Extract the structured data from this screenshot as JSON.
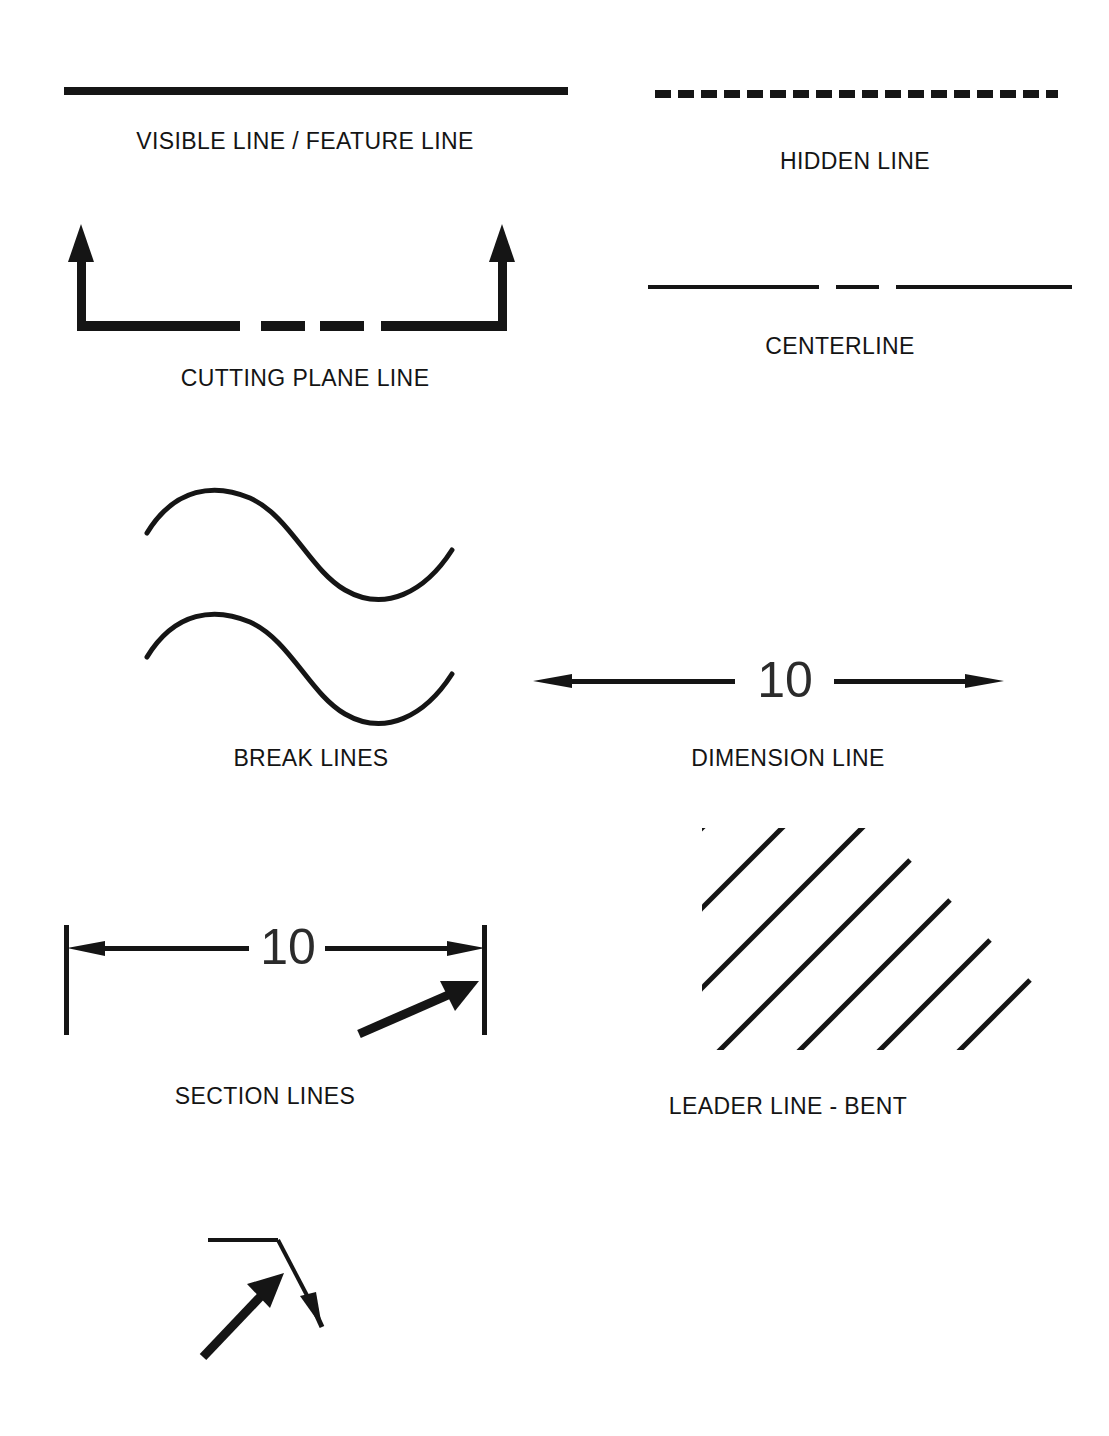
{
  "sheet": {
    "title": "Technical Drawing Line Types Reference",
    "background_color": "#ffffff",
    "ink_color": "#151515",
    "width": 1109,
    "height": 1436
  },
  "figures": [
    {
      "id": "visible-line",
      "caption": "VISIBLE LINE / FEATURE LINE",
      "line_style": "continuous-thick",
      "thickness_px": 7,
      "x1": 64,
      "y1": 91,
      "x2": 568,
      "y2": 91,
      "caption_x": 305,
      "caption_y": 128
    },
    {
      "id": "hidden-line",
      "caption": "HIDDEN LINE",
      "line_style": "dashed-thick",
      "thickness_px": 6,
      "dash": 16,
      "gap": 7,
      "x1": 655,
      "y1": 94,
      "x2": 1058,
      "y2": 94,
      "caption_x": 855,
      "caption_y": 148
    },
    {
      "id": "cutting-plane-line",
      "caption": "CUTTING PLANE LINE",
      "line_style": "long-short-short-long-thick",
      "thickness_px": 9,
      "arrow_count": 2,
      "arrow_direction": "up",
      "caption_x": 305,
      "caption_y": 365
    },
    {
      "id": "centerline",
      "caption": "CENTERLINE",
      "line_style": "long-short-long-thin",
      "thickness_px": 3,
      "x1": 648,
      "y1": 287,
      "x2": 1072,
      "y2": 287,
      "caption_x": 840,
      "caption_y": 333
    },
    {
      "id": "break-lines",
      "caption": "BREAK LINES",
      "line_style": "freehand-wave",
      "thickness_px": 5,
      "wave_count": 2,
      "caption_x": 311,
      "caption_y": 745
    },
    {
      "id": "dimension-line",
      "caption": "DIMENSION LINE",
      "line_style": "continuous-thin-double-arrow",
      "thickness_px": 4,
      "value": "10",
      "x1": 533,
      "y1": 681,
      "x2": 1004,
      "y2": 681,
      "caption_x": 788,
      "caption_y": 745
    },
    {
      "id": "extension-lines",
      "caption": "EXTENSION LINES",
      "line_style": "continuous-thin-vertical-pair",
      "thickness_px": 4,
      "value": "10",
      "left_x": 66,
      "right_x": 484,
      "top_y": 925,
      "bottom_y": 1035,
      "dim_y": 948,
      "caption_x": 265,
      "caption_y": 1083
    },
    {
      "id": "section-lines",
      "caption": "SECTION LINES",
      "line_style": "hatch-45-degree",
      "thickness_px": 4,
      "line_count": 9,
      "angle_deg": 45,
      "caption_x": 788,
      "caption_y": 1093
    },
    {
      "id": "leader-line-bent",
      "caption": "LEADER LINE - BENT",
      "line_style": "leader-with-bend-and-arrow",
      "thickness_px": 3,
      "value": "R1.00",
      "caption_x": 275,
      "caption_y": 1418
    }
  ]
}
